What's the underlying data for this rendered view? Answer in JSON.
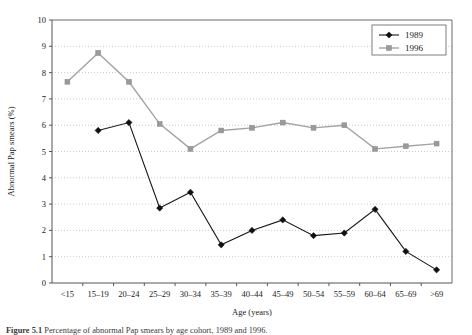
{
  "figure": {
    "caption_label": "Figure 5.1",
    "caption_text": "Percentage of abnormal Pap smears by age cohort, 1989 and 1996."
  },
  "chart_data": {
    "type": "line",
    "title": "",
    "xlabel": "Age (years)",
    "ylabel": "Abnormal Pap smears (%)",
    "categories": [
      "<15",
      "15–19",
      "20–24",
      "25–29",
      "30–34",
      "35–39",
      "40–44",
      "45–49",
      "50–54",
      "55–59",
      "60–64",
      "65–69",
      ">69"
    ],
    "ylim": [
      0,
      10
    ],
    "yticks": [
      0,
      1,
      2,
      3,
      4,
      5,
      6,
      7,
      8,
      9,
      10
    ],
    "ytick_labels": [
      "0",
      "1",
      "2",
      "3",
      "4",
      "5",
      "6",
      "7",
      "8",
      "9",
      "10"
    ],
    "grid": true,
    "grid_axis": "y",
    "legend_position": "top-right",
    "series": [
      {
        "name": "1989",
        "color": "#101010",
        "marker": "diamond",
        "values": [
          null,
          5.8,
          6.1,
          2.85,
          3.45,
          1.45,
          2.0,
          2.4,
          1.8,
          1.9,
          2.8,
          1.2,
          0.5
        ]
      },
      {
        "name": "1996",
        "color": "#9a9a9a",
        "marker": "square",
        "values": [
          7.65,
          8.75,
          7.65,
          6.05,
          5.1,
          5.8,
          5.9,
          6.1,
          5.9,
          6.0,
          5.1,
          5.2,
          5.3
        ]
      }
    ]
  }
}
